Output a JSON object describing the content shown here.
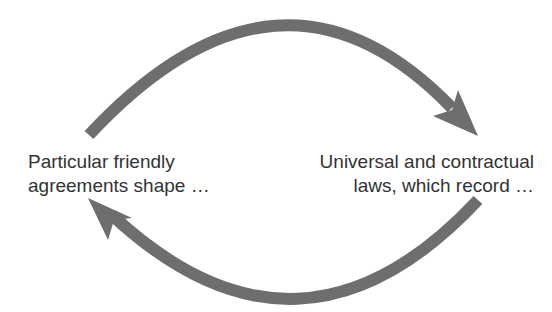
{
  "diagram": {
    "type": "cycle",
    "nodes": [
      {
        "id": "left",
        "lines": [
          "Particular friendly",
          "agreements shape …"
        ]
      },
      {
        "id": "right",
        "lines": [
          "Universal and contractual",
          "laws, which record …"
        ]
      }
    ],
    "edges": [
      {
        "from": "left",
        "to": "right",
        "position": "top"
      },
      {
        "from": "right",
        "to": "left",
        "position": "bottom"
      }
    ],
    "arrow_color": "#6e6e6e",
    "text_color": "#333333"
  }
}
